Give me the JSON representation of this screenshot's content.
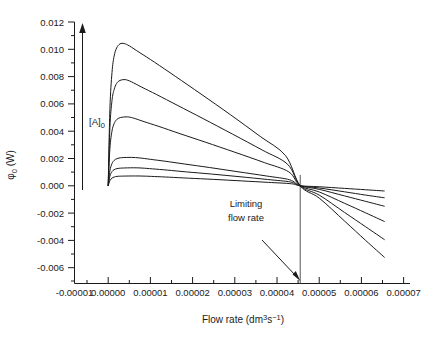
{
  "chart_data": {
    "type": "line",
    "title": "",
    "xlabel": "Flow rate (dm3s-1)",
    "xlabel_parts": {
      "text": "Flow rate (dm",
      "sup1": "3",
      "mid": "s",
      "sup2": "−1",
      "close": ")"
    },
    "ylabel": "φ0 (W)",
    "ylabel_parts": {
      "sym": "φ",
      "sub": "0",
      "unit": " (W)"
    },
    "xlim": [
      -1e-05,
      7e-05
    ],
    "ylim": [
      -0.006,
      0.012
    ],
    "grid": false,
    "legend": "none",
    "xticks": [
      -1e-05,
      0.0,
      1e-05,
      2e-05,
      3e-05,
      4e-05,
      5e-05,
      6e-05,
      7e-05
    ],
    "xtick_labels": [
      "-0.00001",
      "0.00000",
      "0.00001",
      "0.00002",
      "0.00003",
      "0.00004",
      "0.00005",
      "0.00006",
      "0.00007"
    ],
    "yticks": [
      -0.006,
      -0.004,
      -0.002,
      0.0,
      0.002,
      0.004,
      0.006,
      0.008,
      0.01,
      0.012
    ],
    "ytick_labels": [
      "-0.006",
      "-0.004",
      "-0.002",
      "0.000",
      "0.002",
      "0.004",
      "0.006",
      "0.008",
      "0.010",
      "0.012"
    ],
    "minor_ticks_per_interval": 1,
    "limiting_flow_rate": 4.55e-05,
    "series": [
      {
        "name": "curve-1",
        "peak_x": 3.5e-06,
        "peak_y": 0.01042,
        "end_x": 6.55e-05,
        "end_y": -0.00525,
        "points": [
          [
            0.0,
            0.0
          ],
          [
            4e-07,
            0.0056
          ],
          [
            9e-07,
            0.0083
          ],
          [
            1.4e-06,
            0.0095
          ],
          [
            2e-06,
            0.0101
          ],
          [
            2.8e-06,
            0.0104
          ],
          [
            3.8e-06,
            0.01042
          ],
          [
            5e-06,
            0.01025
          ],
          [
            7.5e-06,
            0.00975
          ],
          [
            1.1e-05,
            0.00905
          ],
          [
            1.6e-05,
            0.008
          ],
          [
            2.2e-05,
            0.00672
          ],
          [
            2.9e-05,
            0.0052
          ],
          [
            3.6e-05,
            0.00362
          ],
          [
            4.2e-05,
            0.00222
          ],
          [
            4.55e-05,
            0.0
          ],
          [
            5e-05,
            -0.0009
          ],
          [
            5.6e-05,
            -0.00258
          ],
          [
            6.1e-05,
            -0.004
          ],
          [
            6.55e-05,
            -0.00525
          ]
        ]
      },
      {
        "name": "curve-2",
        "peak_x": 4e-06,
        "peak_y": 0.00778,
        "end_x": 6.55e-05,
        "end_y": -0.00395,
        "points": [
          [
            0.0,
            0.0
          ],
          [
            4e-07,
            0.00425
          ],
          [
            9e-07,
            0.00625
          ],
          [
            1.4e-06,
            0.00705
          ],
          [
            2e-06,
            0.0075
          ],
          [
            2.8e-06,
            0.00772
          ],
          [
            4e-06,
            0.00778
          ],
          [
            5.5e-06,
            0.00762
          ],
          [
            8e-06,
            0.00722
          ],
          [
            1.15e-05,
            0.00668
          ],
          [
            1.65e-05,
            0.00588
          ],
          [
            2.25e-05,
            0.00492
          ],
          [
            2.95e-05,
            0.00378
          ],
          [
            3.65e-05,
            0.00262
          ],
          [
            4.25e-05,
            0.00158
          ],
          [
            4.55e-05,
            0.0
          ],
          [
            5e-05,
            -0.00068
          ],
          [
            5.6e-05,
            -0.00195
          ],
          [
            6.1e-05,
            -0.003
          ],
          [
            6.55e-05,
            -0.00395
          ]
        ]
      },
      {
        "name": "curve-3",
        "peak_x": 4.5e-06,
        "peak_y": 0.00505,
        "end_x": 6.55e-05,
        "end_y": -0.00262,
        "points": [
          [
            0.0,
            0.0
          ],
          [
            4e-07,
            0.00272
          ],
          [
            9e-07,
            0.00402
          ],
          [
            1.4e-06,
            0.00455
          ],
          [
            2e-06,
            0.00485
          ],
          [
            2.9e-06,
            0.005
          ],
          [
            4.5e-06,
            0.00505
          ],
          [
            6e-06,
            0.00496
          ],
          [
            8.5e-06,
            0.0047
          ],
          [
            1.2e-05,
            0.00435
          ],
          [
            1.7e-05,
            0.00382
          ],
          [
            2.3e-05,
            0.0032
          ],
          [
            3e-05,
            0.00246
          ],
          [
            3.7e-05,
            0.0017
          ],
          [
            4.28e-05,
            0.00102
          ],
          [
            4.55e-05,
            0.0
          ],
          [
            5e-05,
            -0.00045
          ],
          [
            5.6e-05,
            -0.00128
          ],
          [
            6.1e-05,
            -0.00198
          ],
          [
            6.55e-05,
            -0.00262
          ]
        ]
      },
      {
        "name": "curve-4",
        "peak_x": 5.5e-06,
        "peak_y": 0.00208,
        "end_x": 6.55e-05,
        "end_y": -0.0015,
        "points": [
          [
            0.0,
            0.0
          ],
          [
            4e-07,
            0.0011
          ],
          [
            9e-07,
            0.00163
          ],
          [
            1.4e-06,
            0.00186
          ],
          [
            2.1e-06,
            0.00199
          ],
          [
            3.2e-06,
            0.00206
          ],
          [
            5.5e-06,
            0.00208
          ],
          [
            7.5e-06,
            0.00204
          ],
          [
            1e-05,
            0.00194
          ],
          [
            1.35e-05,
            0.0018
          ],
          [
            1.8e-05,
            0.0016
          ],
          [
            2.4e-05,
            0.00134
          ],
          [
            3.05e-05,
            0.00104
          ],
          [
            3.75e-05,
            0.00072
          ],
          [
            4.3e-05,
            0.00044
          ],
          [
            4.55e-05,
            0.0
          ],
          [
            5e-05,
            -0.00026
          ],
          [
            5.6e-05,
            -0.00074
          ],
          [
            6.1e-05,
            -0.00114
          ],
          [
            6.55e-05,
            -0.0015
          ]
        ]
      },
      {
        "name": "curve-5",
        "peak_x": 6e-06,
        "peak_y": 0.00132,
        "end_x": 6.55e-05,
        "end_y": -0.00088,
        "points": [
          [
            0.0,
            0.0
          ],
          [
            4e-07,
            0.0007
          ],
          [
            9e-07,
            0.00104
          ],
          [
            1.4e-06,
            0.00118
          ],
          [
            2.1e-06,
            0.00126
          ],
          [
            3.3e-06,
            0.0013
          ],
          [
            6e-06,
            0.00132
          ],
          [
            8e-06,
            0.0013
          ],
          [
            1.05e-05,
            0.00124
          ],
          [
            1.4e-05,
            0.00115
          ],
          [
            1.85e-05,
            0.00102
          ],
          [
            2.45e-05,
            0.00086
          ],
          [
            3.1e-05,
            0.00067
          ],
          [
            3.78e-05,
            0.00046
          ],
          [
            4.32e-05,
            0.00028
          ],
          [
            4.55e-05,
            0.0
          ],
          [
            5e-05,
            -0.00016
          ],
          [
            5.6e-05,
            -0.00044
          ],
          [
            6.1e-05,
            -0.00068
          ],
          [
            6.55e-05,
            -0.00088
          ]
        ]
      },
      {
        "name": "curve-6",
        "peak_x": 6.5e-06,
        "peak_y": 0.00072,
        "end_x": 6.55e-05,
        "end_y": -0.00038,
        "points": [
          [
            0.0,
            0.0
          ],
          [
            4e-07,
            0.00038
          ],
          [
            9e-07,
            0.00056
          ],
          [
            1.4e-06,
            0.00064
          ],
          [
            2.1e-06,
            0.00069
          ],
          [
            3.4e-06,
            0.00071
          ],
          [
            6.5e-06,
            0.00072
          ],
          [
            8.5e-06,
            0.00071
          ],
          [
            1.1e-05,
            0.00068
          ],
          [
            1.45e-05,
            0.00063
          ],
          [
            1.9e-05,
            0.00056
          ],
          [
            2.5e-05,
            0.00047
          ],
          [
            3.15e-05,
            0.00036
          ],
          [
            3.8e-05,
            0.00025
          ],
          [
            4.34e-05,
            0.00015
          ],
          [
            4.55e-05,
            0.0
          ],
          [
            5e-05,
            -7e-05
          ],
          [
            5.6e-05,
            -0.00019
          ],
          [
            6.1e-05,
            -0.00029
          ],
          [
            6.55e-05,
            -0.00038
          ]
        ]
      }
    ],
    "annotations": [
      {
        "name": "concentration-arrow-label",
        "text": "[A]",
        "sub": "0",
        "meaning": "increasing initial concentration",
        "direction": "up"
      },
      {
        "name": "limiting-flow-rate-label",
        "line1": "Limiting",
        "line2": "flow rate",
        "direction": "down-right"
      }
    ]
  }
}
